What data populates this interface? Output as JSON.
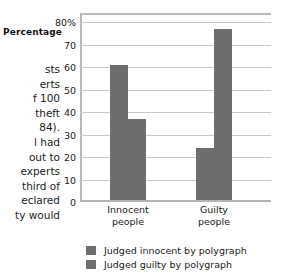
{
  "page_text": {
    "lines": [
      "sts",
      "erts",
      "f 100",
      " theft",
      "84).",
      "l had",
      "out to",
      "experts",
      "third of",
      "eclared",
      "ty would"
    ]
  },
  "chart_data": {
    "type": "bar",
    "title": "",
    "xlabel": "",
    "ylabel": "Percentage",
    "categories": [
      "Innocent people",
      "Guilty people"
    ],
    "category_lines": [
      [
        "Innocent",
        "people"
      ],
      [
        "Guilty",
        "people"
      ]
    ],
    "series": [
      {
        "name": "Judged innocent by polygraph",
        "values": [
          61,
          24
        ],
        "color": "#6e6e6e"
      },
      {
        "name": "Judged guilty by polygraph",
        "values": [
          37,
          77
        ],
        "color": "#6e6e6e"
      }
    ],
    "ylim": [
      0,
      80
    ],
    "yticks": [
      "80%",
      "70",
      "60",
      "50",
      "40",
      "30",
      "20",
      "10",
      "0"
    ],
    "ytick_values": [
      80,
      70,
      60,
      50,
      40,
      30,
      20,
      10,
      0
    ],
    "grid": true,
    "legend_position": "bottom-left",
    "bar_color": "#6e6e6e",
    "gridline_color": "#c9c9c9",
    "frame_color": "#b9b9b9"
  }
}
